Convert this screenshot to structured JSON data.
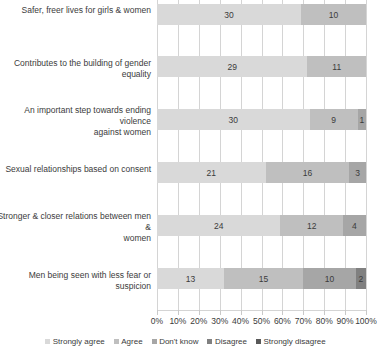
{
  "chart_data": {
    "type": "bar",
    "orientation": "horizontal",
    "stacked": true,
    "title": "",
    "subtitle": "",
    "xlabel": "",
    "ylabel": "",
    "xlim": [
      0,
      100
    ],
    "grid": true,
    "legend_position": "bottom",
    "categories": [
      "Safer, freer lives for girls & women",
      "Contributes to the building of gender equality",
      "An important step towards ending violence against women",
      "Sexual relationships based on consent",
      "Stronger & closer relations between men & women",
      "Men being seen with less fear or suspicion"
    ],
    "series": [
      {
        "name": "Strongly agree",
        "values": [
          30,
          29,
          30,
          21,
          24,
          13
        ]
      },
      {
        "name": "Agree",
        "values": [
          10,
          11,
          9,
          16,
          12,
          15
        ]
      },
      {
        "name": "Don't know",
        "values": [
          0,
          0,
          1,
          3,
          4,
          10
        ]
      },
      {
        "name": "Disagree",
        "values": [
          0,
          0,
          0,
          0,
          0,
          2
        ]
      },
      {
        "name": "Strongly disagree",
        "values": [
          0,
          0,
          0,
          0,
          0,
          0
        ]
      }
    ],
    "xticks": [
      "0%",
      "10%",
      "20%",
      "30%",
      "40%",
      "50%",
      "60%",
      "70%",
      "80%",
      "90%",
      "100%"
    ],
    "colors": {
      "strongly_agree": "#d9d9d9",
      "agree": "#bfbfbf",
      "dont_know": "#a6a6a6",
      "disagree": "#808080",
      "strongly_disagree": "#595959"
    },
    "bars": [
      {
        "category": "Safer, freer lives for girls & women",
        "segments": [
          {
            "series": "Strongly agree",
            "label": "30",
            "pct": 69.0
          },
          {
            "series": "Agree",
            "label": "10",
            "pct": 31.0
          }
        ]
      },
      {
        "category": "Contributes to the building of gender equality",
        "segments": [
          {
            "series": "Strongly agree",
            "label": "29",
            "pct": 72.0
          },
          {
            "series": "Agree",
            "label": "11",
            "pct": 28.0
          }
        ]
      },
      {
        "category": "An important step towards ending violence against women",
        "segments": [
          {
            "series": "Strongly agree",
            "label": "30",
            "pct": 73.0
          },
          {
            "series": "Agree",
            "label": "9",
            "pct": 23.0
          },
          {
            "series": "Don't know",
            "label": "1",
            "pct": 4.0
          }
        ]
      },
      {
        "category": "Sexual relationships based on consent",
        "segments": [
          {
            "series": "Strongly agree",
            "label": "21",
            "pct": 52.0
          },
          {
            "series": "Agree",
            "label": "16",
            "pct": 40.0
          },
          {
            "series": "Don't know",
            "label": "3",
            "pct": 8.0
          }
        ]
      },
      {
        "category": "Stronger & closer relations between men & women",
        "segments": [
          {
            "series": "Strongly agree",
            "label": "24",
            "pct": 59.0
          },
          {
            "series": "Agree",
            "label": "12",
            "pct": 30.0
          },
          {
            "series": "Don't know",
            "label": "4",
            "pct": 11.0
          }
        ]
      },
      {
        "category": "Men being seen with less fear or suspicion",
        "segments": [
          {
            "series": "Strongly agree",
            "label": "13",
            "pct": 32.0
          },
          {
            "series": "Agree",
            "label": "15",
            "pct": 38.0
          },
          {
            "series": "Don't know",
            "label": "10",
            "pct": 25.0
          },
          {
            "series": "Disagree",
            "label": "2",
            "pct": 5.0
          }
        ]
      }
    ]
  },
  "axis": {
    "ticks": [
      "0%",
      "10%",
      "20%",
      "30%",
      "40%",
      "50%",
      "60%",
      "70%",
      "80%",
      "90%",
      "100%"
    ]
  },
  "legend": {
    "items": [
      {
        "label": "Strongly agree"
      },
      {
        "label": "Agree"
      },
      {
        "label": "Don't know"
      },
      {
        "label": "Disagree"
      },
      {
        "label": "Strongly disagree"
      }
    ]
  },
  "category_labels": [
    {
      "lines": [
        "Safer, freer lives for girls & women"
      ]
    },
    {
      "lines": [
        "Contributes to the building of gender equality"
      ]
    },
    {
      "lines": [
        "An important step towards ending violence",
        "against women"
      ]
    },
    {
      "lines": [
        "Sexual relationships based on consent"
      ]
    },
    {
      "lines": [
        "Stronger & closer relations between men &",
        "women"
      ]
    },
    {
      "lines": [
        "Men being seen with less fear or suspicion"
      ]
    }
  ]
}
